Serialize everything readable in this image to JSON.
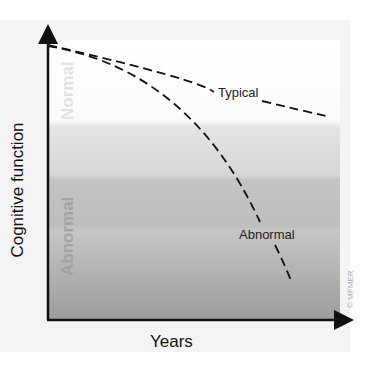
{
  "diagram": {
    "y_axis_label": "Cognitive function",
    "x_axis_label": "Years",
    "zones": {
      "top": "Normal",
      "bottom": "Abnormal"
    },
    "curves": [
      {
        "label": "Typical",
        "style": "dashed"
      },
      {
        "label": "Abnormal",
        "style": "dashed"
      }
    ],
    "copyright": "© MFMER"
  },
  "colors": {
    "normal_band": "#ffffff",
    "transition_band_1": "#dedede",
    "transition_band_2": "#cacaca",
    "abnormal_band_bottom": "#9e9e9e",
    "line": "#111111"
  }
}
